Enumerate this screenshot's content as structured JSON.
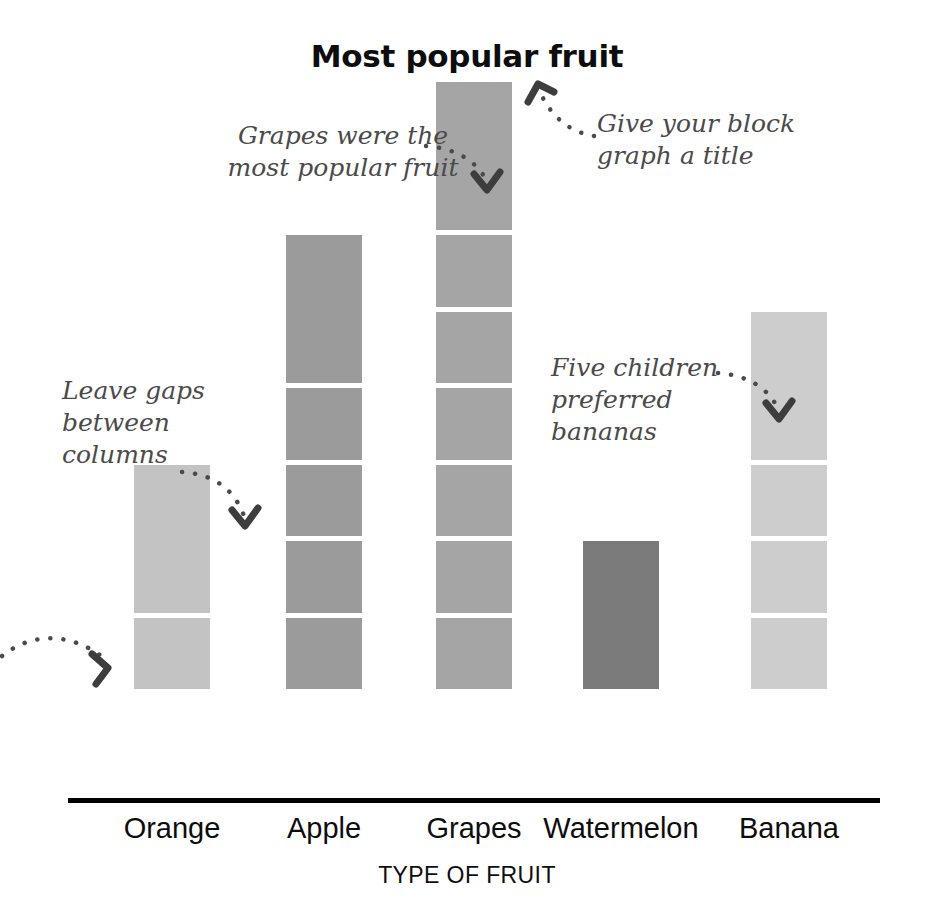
{
  "chart_data": {
    "type": "bar",
    "title": "Most popular fruit",
    "xlabel": "TYPE OF FRUIT",
    "ylabel": "",
    "grid": false,
    "legend": "none",
    "unit_note": "pictogram-style block graph: each block = 1 child",
    "ylim": [
      0,
      8
    ],
    "categories": [
      "Orange",
      "Apple",
      "Grapes",
      "Watermelon",
      "Banana"
    ],
    "values": [
      3,
      6,
      8,
      2,
      5
    ],
    "bar_colors": [
      "#c3c3c3",
      "#9b9b9b",
      "#a5a5a5",
      "#7b7b7b",
      "#cdcdcd"
    ],
    "annotations": [
      "Grapes were the most popular fruit",
      "Give your block graph a title",
      "Leave gaps between columns",
      "Five children preferred bananas"
    ]
  },
  "title": "Most popular fruit",
  "axis": {
    "x_title": "TYPE OF FRUIT",
    "categories": [
      {
        "label": "Orange",
        "value": 3
      },
      {
        "label": "Apple",
        "value": 6
      },
      {
        "label": "Grapes",
        "value": 8
      },
      {
        "label": "Watermelon",
        "value": 2
      },
      {
        "label": "Banana",
        "value": 5
      }
    ]
  },
  "annotations": {
    "grapes": "Grapes were the\nmost popular fruit",
    "title_hint": "Give your block\ngraph a title",
    "gaps": "Leave gaps\nbetween\ncolumns",
    "bananas": "Five children\npreferred\nbananas"
  },
  "colors": {
    "orange": "#c3c3c3",
    "apple": "#9b9b9b",
    "grapes": "#a5a5a5",
    "watermelon": "#7b7b7b",
    "banana": "#cdcdcd",
    "axis": "#000000",
    "annotation_text": "#4a4a4a",
    "title_text": "#0d0d0d",
    "block_gap": "#ffffff"
  }
}
